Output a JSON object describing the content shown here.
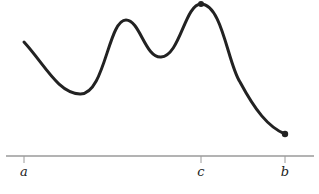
{
  "diagram": {
    "axis_labels": {
      "a": "a",
      "c": "c",
      "b": "b"
    },
    "colors": {
      "curve": "#222222",
      "axis": "#999999",
      "text": "#222222"
    }
  }
}
